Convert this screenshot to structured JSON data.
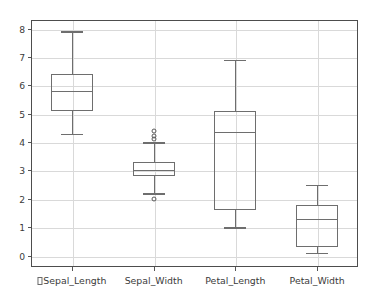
{
  "chart_data": {
    "type": "box",
    "title": "",
    "xlabel": "",
    "ylabel": "",
    "ylim": [
      -0.4,
      8.3
    ],
    "grid": true,
    "legend": null,
    "yticks": [
      0,
      1,
      2,
      3,
      4,
      5,
      6,
      7,
      8
    ],
    "ytick_labels": [
      "0",
      "1",
      "2",
      "3",
      "4",
      "5",
      "6",
      "7",
      "8"
    ],
    "categories": [
      "Sepal_Length",
      "Sepal_Width",
      "Petal_Length",
      "Petal_Width"
    ],
    "xtick_labels": [
      "□Sepal_Length",
      "Sepal_Width",
      "Petal_Length",
      "Petal_Width"
    ],
    "first_label_has_missing_glyph": true,
    "boxes": [
      {
        "name": "Sepal_Length",
        "whisker_low": 4.3,
        "q1": 5.1,
        "median": 5.8,
        "q3": 6.4,
        "whisker_high": 7.9,
        "outliers": []
      },
      {
        "name": "Sepal_Width",
        "whisker_low": 2.2,
        "q1": 2.8,
        "median": 3.0,
        "q3": 3.3,
        "whisker_high": 4.0,
        "outliers": [
          4.4,
          4.2,
          4.1,
          2.0
        ]
      },
      {
        "name": "Petal_Length",
        "whisker_low": 1.0,
        "q1": 1.6,
        "median": 4.35,
        "q3": 5.1,
        "whisker_high": 6.9,
        "outliers": []
      },
      {
        "name": "Petal_Width",
        "whisker_low": 0.1,
        "q1": 0.3,
        "median": 1.3,
        "q3": 1.8,
        "whisker_high": 2.5,
        "outliers": []
      }
    ]
  },
  "style": {
    "background": "#ffffff",
    "frame_color": "#4d4d4d",
    "grid_color": "#d9d9d9",
    "box_color": "#6e6e6e",
    "text_color": "#3b3b3b"
  }
}
